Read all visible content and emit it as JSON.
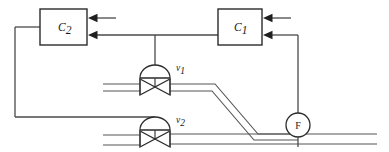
{
  "diagram": {
    "type": "process-instrumentation-diagram",
    "colors": {
      "line": "#3f3f3f",
      "pipe": "#555555",
      "signal": "#4a4a4a",
      "outline": "#2b2b2b",
      "arrow": "#1f1f1f",
      "background": "#ffffff",
      "text": "#1a1a1a"
    },
    "controllers": [
      {
        "name": "controller-c2",
        "label_main": "C",
        "label_sub": "2",
        "x": 40,
        "y": 9,
        "width": 47,
        "height": 36,
        "inputs": 2
      },
      {
        "name": "controller-c1",
        "label_main": "C",
        "label_sub": "1",
        "x": 218,
        "y": 9,
        "width": 44,
        "height": 36,
        "inputs": 2
      }
    ],
    "valves": [
      {
        "name": "valve-v1",
        "label_main": "v",
        "label_sub": "1",
        "cx": 155,
        "cy": 87,
        "actuator_cy": 73
      },
      {
        "name": "valve-v2",
        "label_main": "v",
        "label_sub": "2",
        "cx": 155,
        "cy": 139,
        "actuator_cy": 125
      }
    ],
    "meter": {
      "name": "flow-meter",
      "label": "F",
      "cx": 298,
      "cy": 125,
      "r": 12
    },
    "pipes": [
      {
        "name": "upper-pipe-inlet",
        "orientation": "horizontal"
      },
      {
        "name": "upper-pipe-outlet-diagonal",
        "orientation": "diagonal"
      },
      {
        "name": "lower-pipe-inlet",
        "orientation": "horizontal"
      },
      {
        "name": "lower-pipe-outlet",
        "orientation": "horizontal"
      }
    ],
    "signals": [
      {
        "name": "c1-to-c2-setpoint",
        "from": "controller-c1",
        "to": "controller-c2"
      },
      {
        "name": "c1-branch-to-valve-v1",
        "from": "controller-c1",
        "to": "valve-v1"
      },
      {
        "name": "c2-output-to-valve-v2",
        "from": "controller-c2",
        "to": "valve-v2"
      },
      {
        "name": "flow-meter-to-c1",
        "from": "flow-meter",
        "to": "controller-c1"
      },
      {
        "name": "external-setpoint-c1",
        "to": "controller-c1"
      },
      {
        "name": "external-setpoint-c2",
        "to": "controller-c2"
      }
    ]
  }
}
